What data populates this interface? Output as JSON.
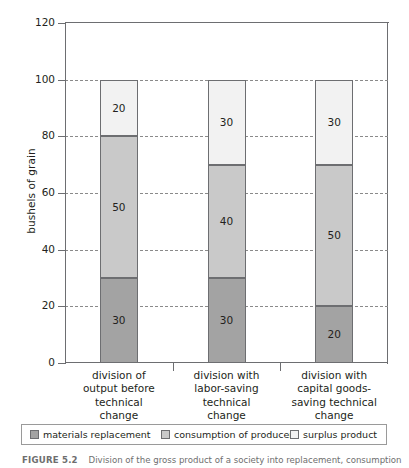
{
  "chart_data": {
    "type": "bar",
    "subtype": "stacked-column",
    "title": "",
    "xlabel": "",
    "ylabel": "bushels of grain",
    "ylim": [
      0,
      120
    ],
    "yticks": [
      0,
      20,
      40,
      60,
      80,
      100,
      120
    ],
    "ytick_labels": [
      "0",
      "20",
      "40",
      "60",
      "80",
      "100",
      "120"
    ],
    "grid": "horizontal-dashed",
    "legend_position": "bottom",
    "categories": [
      "division of output before technical change",
      "division with labor-saving technical change",
      "division with capital goods-saving technical change"
    ],
    "category_lines": [
      [
        "division of",
        "output before",
        "technical",
        "change"
      ],
      [
        "division with",
        "labor-saving",
        "technical",
        "change"
      ],
      [
        "division with",
        "capital goods-",
        "saving technical",
        "change"
      ]
    ],
    "series": [
      {
        "name": "materials replacement",
        "color": "#a3a3a3",
        "values": [
          30,
          30,
          20
        ]
      },
      {
        "name": "consumption of producers",
        "color": "#c9c9c9",
        "values": [
          50,
          40,
          50
        ]
      },
      {
        "name": "surplus product",
        "color": "#f2f2f2",
        "values": [
          20,
          30,
          30
        ]
      }
    ],
    "totals": [
      100,
      100,
      100
    ],
    "bar_labels": [
      [
        "30",
        "50",
        "20"
      ],
      [
        "30",
        "40",
        "30"
      ],
      [
        "20",
        "50",
        "30"
      ]
    ]
  },
  "axes": {
    "y_title": "bushels of grain",
    "y_ticks": [
      "120",
      "100",
      "80",
      "60",
      "40",
      "20",
      "0"
    ]
  },
  "legend": {
    "items": [
      {
        "label": "materials replacement",
        "color": "#a3a3a3"
      },
      {
        "label": "consumption of producers",
        "color": "#c9c9c9"
      },
      {
        "label": "surplus product",
        "color": "#f2f2f2"
      }
    ]
  },
  "caption": {
    "label": "FIGURE 5.2",
    "text": "Division of the gross product of a society into replacement, consumption and surplus"
  }
}
